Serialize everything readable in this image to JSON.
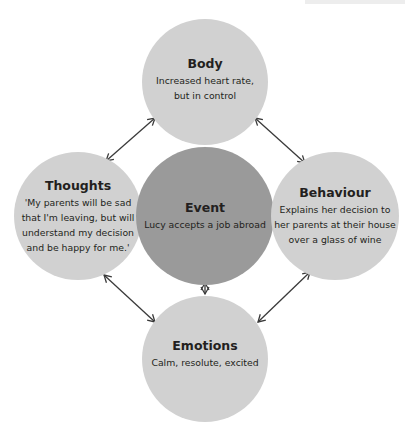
{
  "diagram": {
    "type": "hot-cross-bun",
    "nodes": {
      "body": {
        "title": "Body",
        "lines": [
          "Increased heart rate,",
          "but in control"
        ]
      },
      "thoughts": {
        "title": "Thoughts",
        "lines": [
          "'My parents will be sad",
          "that I'm leaving, but will",
          "understand my decision",
          "and be happy for me.'"
        ]
      },
      "event": {
        "title": "Event",
        "lines": [
          "Lucy accepts a job abroad"
        ]
      },
      "behaviour": {
        "title": "Behaviour",
        "lines": [
          "Explains her decision to",
          "her parents at their house",
          "over a glass of wine"
        ]
      },
      "emotions": {
        "title": "Emotions",
        "lines": [
          "Calm, resolute, excited"
        ]
      }
    },
    "connections": [
      {
        "from": "body",
        "to": "event",
        "style": "bidirectional"
      },
      {
        "from": "thoughts",
        "to": "event",
        "style": "bidirectional"
      },
      {
        "from": "behaviour",
        "to": "event",
        "style": "bidirectional"
      },
      {
        "from": "emotions",
        "to": "event",
        "style": "bidirectional"
      },
      {
        "from": "body",
        "to": "thoughts",
        "style": "bidirectional"
      },
      {
        "from": "body",
        "to": "behaviour",
        "style": "bidirectional"
      },
      {
        "from": "thoughts",
        "to": "emotions",
        "style": "bidirectional"
      },
      {
        "from": "behaviour",
        "to": "emotions",
        "style": "bidirectional"
      }
    ],
    "colors": {
      "outer_circle": "#d1d1d1",
      "center_circle": "#9a9a9a",
      "arrow": "#3a3a3a",
      "text": "#231f20"
    }
  }
}
